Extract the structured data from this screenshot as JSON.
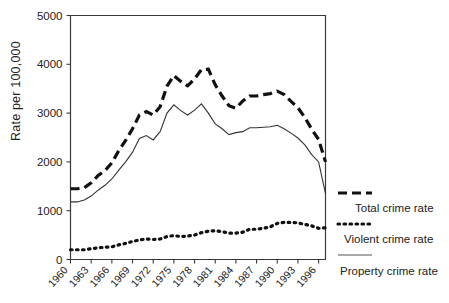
{
  "chart_data": {
    "type": "line",
    "title": "",
    "xlabel": "",
    "ylabel": "Rate per 100,000",
    "xlim": [
      1960,
      1997
    ],
    "ylim": [
      0,
      5000
    ],
    "ytick_values": [
      0,
      1000,
      2000,
      3000,
      4000,
      5000
    ],
    "ytick_labels": [
      "0",
      "1000",
      "2000",
      "3000",
      "4000",
      "5000"
    ],
    "xtick_labels": [
      "1960",
      "1963",
      "1966",
      "1969",
      "1972",
      "1975",
      "1978",
      "1981",
      "1984",
      "1987",
      "1990",
      "1993",
      "1996"
    ],
    "xtick_values": [
      1960,
      1963,
      1966,
      1969,
      1972,
      1975,
      1978,
      1981,
      1984,
      1987,
      1990,
      1993,
      1996
    ],
    "grid": false,
    "legend_position": "right",
    "x": [
      1960,
      1961,
      1962,
      1963,
      1964,
      1965,
      1966,
      1967,
      1968,
      1969,
      1970,
      1971,
      1972,
      1973,
      1974,
      1975,
      1976,
      1977,
      1978,
      1979,
      1980,
      1981,
      1982,
      1983,
      1984,
      1985,
      1986,
      1987,
      1988,
      1989,
      1990,
      1991,
      1992,
      1993,
      1994,
      1995,
      1996,
      1997
    ],
    "series": [
      {
        "name": "Total crime rate",
        "style": "dashed",
        "values": [
          1450,
          1450,
          1470,
          1570,
          1720,
          1820,
          1980,
          2230,
          2440,
          2680,
          2960,
          3030,
          2960,
          3130,
          3550,
          3770,
          3650,
          3560,
          3700,
          3890,
          3900,
          3580,
          3350,
          3150,
          3100,
          3250,
          3350,
          3350,
          3380,
          3400,
          3450,
          3380,
          3240,
          3110,
          2910,
          2670,
          2460,
          2000
        ]
      },
      {
        "name": "Violent crime rate",
        "style": "dotted",
        "values": [
          200,
          200,
          200,
          220,
          240,
          250,
          260,
          300,
          330,
          370,
          400,
          420,
          410,
          420,
          470,
          490,
          470,
          480,
          500,
          550,
          580,
          590,
          570,
          540,
          540,
          560,
          620,
          620,
          640,
          670,
          740,
          760,
          760,
          750,
          720,
          690,
          640,
          650
        ]
      },
      {
        "name": "Property crime rate",
        "style": "solid",
        "values": [
          1180,
          1180,
          1220,
          1300,
          1420,
          1520,
          1650,
          1830,
          2000,
          2200,
          2480,
          2540,
          2450,
          2620,
          3000,
          3170,
          3050,
          2960,
          3060,
          3190,
          3000,
          2780,
          2680,
          2560,
          2600,
          2620,
          2700,
          2700,
          2710,
          2720,
          2750,
          2680,
          2590,
          2490,
          2350,
          2150,
          2000,
          1350
        ]
      }
    ],
    "annotations": []
  },
  "legend": {
    "items": [
      {
        "label": "Total crime rate",
        "style": "dashed"
      },
      {
        "label": "Violent crime rate",
        "style": "dotted"
      },
      {
        "label": "Property crime rate",
        "style": "solid"
      }
    ]
  }
}
